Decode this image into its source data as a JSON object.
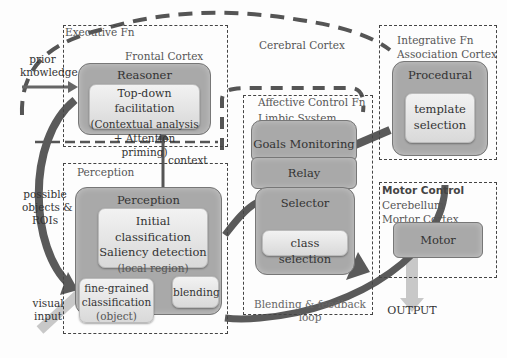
{
  "diagram": {
    "regions": {
      "executive": {
        "label": "Executive Fn",
        "sublabel": "Frontal Cortex"
      },
      "cerebral": {
        "label": "Cerebral Cortex"
      },
      "integrative": {
        "label": "Integrative Fn",
        "sublabel": "Association Cortex"
      },
      "affective": {
        "label": "Affective Control Fn",
        "sublabel": "Limbic System"
      },
      "perception": {
        "label": "Perception"
      },
      "motor": {
        "label": "Motor Control",
        "sublabel1": "Cerebellum",
        "sublabel2": "Mortor Cortex"
      }
    },
    "boxes": {
      "reasoner": {
        "title": "Reasoner",
        "inner_line1": "Top-down facilitation",
        "inner_line2": "(Contextual analysis",
        "inner_line3": "+ Attention priming)"
      },
      "procedural": {
        "title": "Procedural",
        "inner_line1": "template",
        "inner_line2": "selection"
      },
      "goals": {
        "title": "Goals Monitoring"
      },
      "relay": {
        "title": "Relay"
      },
      "selector": {
        "title": "Selector",
        "inner": "class selection"
      },
      "perception": {
        "title": "Perception",
        "inner_line1": "Initial classification",
        "inner_line2": "Saliency detection",
        "inner_line3": "(local region)"
      },
      "fine": {
        "line1": "fine-grained",
        "line2": "classification",
        "line3": "(object)"
      },
      "blending": {
        "label": "blending"
      },
      "motor": {
        "title": "Motor"
      }
    },
    "annotations": {
      "prior_knowledge_1": "prior",
      "prior_knowledge_2": "knowledge",
      "context": "context",
      "possible_1": "possible",
      "possible_2": "objects &",
      "possible_3": "ROIs",
      "visual_1": "visual",
      "visual_2": "input",
      "loop_1": "Blending & feedback",
      "loop_2": "loop",
      "output": "OUTPUT"
    },
    "colors": {
      "box_fill": "#a9a9a9",
      "inner_fill": "#e6e6e6",
      "arrow_dark": "#5a5a5a",
      "arrow_light": "#c8c8c8",
      "dash": "#555555"
    }
  }
}
